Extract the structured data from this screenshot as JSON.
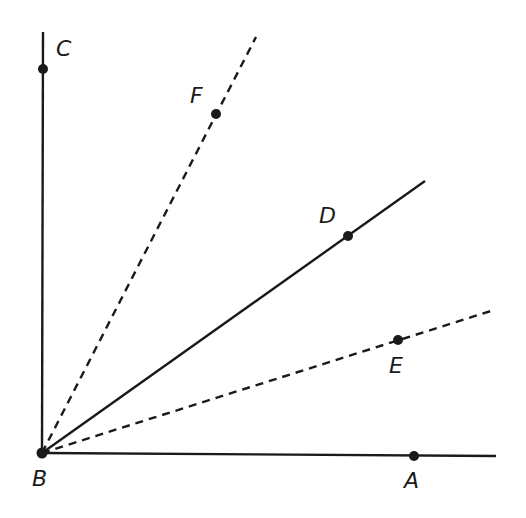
{
  "diagram": {
    "vertex": {
      "name": "B",
      "x": 42,
      "y": 453,
      "label_x": 32,
      "label_y": 486
    },
    "points": [
      {
        "name": "C",
        "x": 43,
        "y": 69,
        "label_x": 56,
        "label_y": 56
      },
      {
        "name": "F",
        "x": 216,
        "y": 114,
        "label_x": 190,
        "label_y": 103
      },
      {
        "name": "D",
        "x": 348,
        "y": 236,
        "label_x": 319,
        "label_y": 223
      },
      {
        "name": "E",
        "x": 398,
        "y": 340,
        "label_x": 389,
        "label_y": 373
      },
      {
        "name": "A",
        "x": 414,
        "y": 456,
        "label_x": 404,
        "label_y": 488
      }
    ],
    "rays": [
      {
        "name": "ray-BC",
        "x2": 43,
        "y2": 32,
        "style": "solid"
      },
      {
        "name": "ray-BF",
        "x2": 256,
        "y2": 37,
        "style": "dashed"
      },
      {
        "name": "ray-BD",
        "x2": 425,
        "y2": 181,
        "style": "solid"
      },
      {
        "name": "ray-BE",
        "x2": 494,
        "y2": 310,
        "style": "dashed"
      },
      {
        "name": "ray-BA",
        "x2": 496,
        "y2": 456,
        "style": "solid"
      }
    ],
    "colors": {
      "line": "#1a1a1a",
      "background": "#ffffff"
    }
  }
}
